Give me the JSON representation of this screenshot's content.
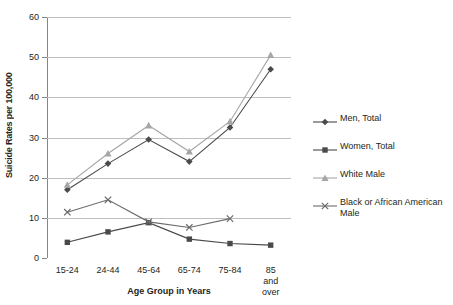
{
  "chart_data": {
    "type": "line",
    "title": "",
    "xlabel": "Age Group in Years",
    "ylabel": "Suicide Rates per 100,000",
    "categories": [
      "15-24",
      "24-44",
      "45-64",
      "65-74",
      "75-84",
      "85 and\nover"
    ],
    "ylim": [
      0,
      60
    ],
    "yticks": [
      0,
      10,
      20,
      30,
      40,
      50,
      60
    ],
    "grid": true,
    "legend_position": "right",
    "series": [
      {
        "name": "Men, Total",
        "marker": "diamond",
        "color": "#4a4a4a",
        "values": [
          17.0,
          23.5,
          29.5,
          24.0,
          32.5,
          47.0
        ]
      },
      {
        "name": "Women, Total",
        "marker": "square",
        "color": "#4a4a4a",
        "values": [
          3.9,
          6.5,
          8.8,
          4.7,
          3.6,
          3.2
        ]
      },
      {
        "name": "White Male",
        "marker": "triangle",
        "color": "#a6a6a6",
        "values": [
          18.2,
          26.0,
          33.0,
          26.5,
          34.0,
          50.5
        ]
      },
      {
        "name": "Black or African American Male",
        "marker": "x",
        "color": "#6b6b6b",
        "values": [
          11.4,
          14.5,
          9.0,
          7.6,
          9.8,
          null
        ]
      }
    ]
  },
  "axis": {
    "y_title": "Suicide Rates per 100,000",
    "x_title": "Age Group in Years",
    "y_ticks": [
      "0",
      "10",
      "20",
      "30",
      "40",
      "50",
      "60"
    ],
    "x_ticks": [
      "15-24",
      "24-44",
      "45-64",
      "65-74",
      "75-84",
      "85 and\nover"
    ]
  },
  "legend": {
    "items": [
      {
        "label": "Men, Total"
      },
      {
        "label": "Women, Total"
      },
      {
        "label": "White Male"
      },
      {
        "label": "Black or African American Male"
      }
    ]
  }
}
